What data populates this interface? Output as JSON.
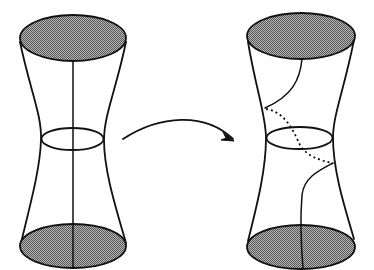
{
  "diagram": {
    "colors": {
      "line": "#111111",
      "disk_fill": "#8c8c8c",
      "background": "#ffffff"
    },
    "shapes": [
      {
        "id": "left-tube",
        "curve": "straight vertical arc",
        "end_disks": "shaded"
      },
      {
        "id": "right-tube",
        "curve": "twisted arc with hidden dotted segment",
        "end_disks": "shaded"
      }
    ],
    "arrow": {
      "from": "left-tube",
      "to": "right-tube",
      "style": "curved"
    }
  }
}
